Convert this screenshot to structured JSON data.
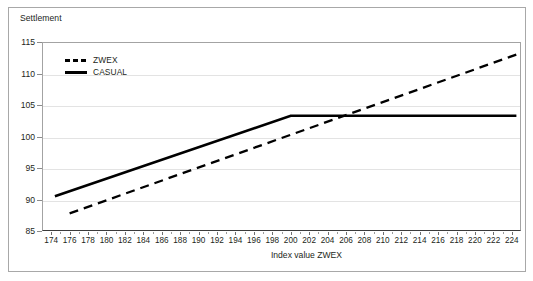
{
  "chart_title": "Settlement",
  "axes": {
    "x_title": "Index value ZWEX",
    "x_ticks": [
      174,
      176,
      178,
      180,
      182,
      184,
      186,
      188,
      190,
      192,
      194,
      196,
      198,
      200,
      202,
      204,
      206,
      208,
      210,
      212,
      214,
      216,
      218,
      220,
      222,
      224
    ],
    "y_ticks": [
      85,
      90,
      95,
      100,
      105,
      110,
      115
    ]
  },
  "legend": {
    "items": [
      {
        "label": "ZWEX",
        "style": "dashed"
      },
      {
        "label": "CASUAL",
        "style": "solid"
      }
    ]
  },
  "chart_data": {
    "type": "line",
    "title": "Settlement",
    "xlabel": "Index value ZWEX",
    "ylabel": "Settlement",
    "xlim": [
      173,
      225
    ],
    "ylim": [
      85,
      115
    ],
    "grid": true,
    "legend_position": "upper-left inside",
    "series": [
      {
        "name": "ZWEX",
        "style": "dashed",
        "color": "#000000",
        "points": [
          {
            "x": 176.0,
            "y": 87.8
          },
          {
            "x": 224.5,
            "y": 113.0
          }
        ]
      },
      {
        "name": "CASUAL",
        "style": "solid",
        "color": "#000000",
        "points": [
          {
            "x": 174.4,
            "y": 90.5
          },
          {
            "x": 200.0,
            "y": 103.3
          },
          {
            "x": 224.5,
            "y": 103.3
          }
        ]
      }
    ],
    "annotations": [
      {
        "text": "lines cross near index 207.5 at settlement 103.3"
      }
    ]
  }
}
